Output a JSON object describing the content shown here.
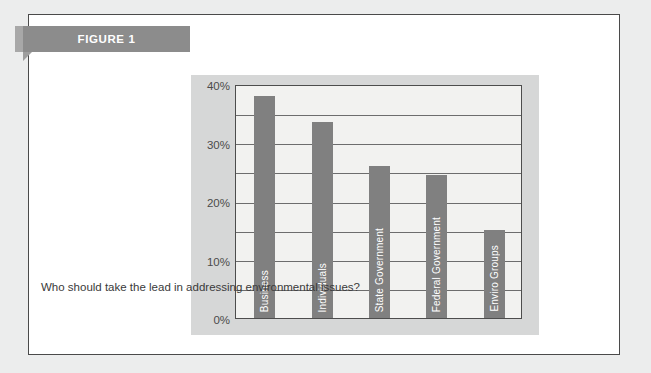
{
  "figure": {
    "ribbon_label": "FIGURE 1",
    "caption": "Who should take the lead in addressing environmental issues?"
  },
  "colors": {
    "page_background": "#eceded",
    "card_background": "#ffffff",
    "card_border": "#4a4a4a",
    "ribbon": "#8c8c8c",
    "ribbon_text": "#ffffff",
    "chart_panel": "#d6d7d7",
    "plot_background": "#f2f2f0",
    "bar": "#808080",
    "gridline": "#6d6d6d",
    "axis_text": "#4b4b4b",
    "bar_label_text": "#ffffff"
  },
  "chart_data": {
    "type": "bar",
    "title": "",
    "subtitle": "",
    "xlabel": "",
    "ylabel": "",
    "categories": [
      "Business",
      "Individuals",
      "State Government",
      "Federal Government",
      "Enviro Groups"
    ],
    "values": [
      38,
      33.5,
      26,
      24.5,
      15
    ],
    "value_suffix": "%",
    "ylim": [
      0,
      40
    ],
    "ytick_labels": [
      "0%",
      "10%",
      "20%",
      "30%",
      "40%"
    ],
    "ytick_values": [
      0,
      10,
      20,
      30,
      40
    ],
    "gridline_values": [
      5,
      10,
      15,
      20,
      25,
      30,
      35
    ],
    "grid": true,
    "legend": "none",
    "orientation": "vertical",
    "bar_labels_inside": true,
    "bar_label_rotation": "vertical-bottom-up"
  }
}
